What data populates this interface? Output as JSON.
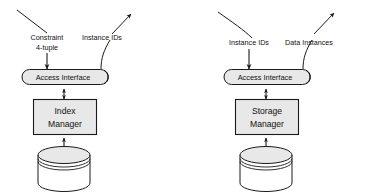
{
  "diagram": {
    "type": "block-diagram",
    "background_color": "#ffffff",
    "line_color": "#1a1a1a",
    "shape_fill": "#e8e8e8",
    "panels": [
      {
        "id": "index-panel",
        "inputs": [
          {
            "id": "constraint-4-tuple",
            "label_line1": "Constraint",
            "label_line2": "4-tuple",
            "direction": "in",
            "arrowhead": true
          },
          {
            "id": "instance-ids-out-left",
            "label_line1": "Instance IDs",
            "label_line2": "",
            "direction": "out",
            "arrowhead": true
          }
        ],
        "interface": {
          "id": "access-interface-left",
          "label": "Access Interface",
          "shape": "stadium"
        },
        "manager": {
          "id": "index-manager",
          "label_line1": "Index",
          "label_line2": "Manager",
          "shape": "rectangle"
        },
        "store": {
          "id": "index-store",
          "label": "",
          "shape": "cylinder"
        },
        "connectors": [
          {
            "from": "access-interface-left",
            "to": "index-manager",
            "style": "double-arrow"
          },
          {
            "from": "index-manager",
            "to": "index-store",
            "style": "double-arrow"
          }
        ]
      },
      {
        "id": "storage-panel",
        "inputs": [
          {
            "id": "instance-ids-in-right",
            "label_line1": "Instance IDs",
            "label_line2": "",
            "direction": "in",
            "arrowhead": true
          },
          {
            "id": "data-instances-out-right",
            "label_line1": "Data Instances",
            "label_line2": "",
            "direction": "out",
            "arrowhead": true
          }
        ],
        "interface": {
          "id": "access-interface-right",
          "label": "Access Interface",
          "shape": "stadium"
        },
        "manager": {
          "id": "storage-manager",
          "label_line1": "Storage",
          "label_line2": "Manager",
          "shape": "rectangle"
        },
        "store": {
          "id": "storage-store",
          "label": "",
          "shape": "cylinder"
        },
        "connectors": [
          {
            "from": "access-interface-right",
            "to": "storage-manager",
            "style": "double-arrow"
          },
          {
            "from": "storage-manager",
            "to": "storage-store",
            "style": "double-arrow"
          }
        ]
      }
    ]
  }
}
